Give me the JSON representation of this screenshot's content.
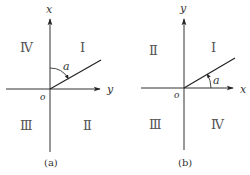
{
  "panels": [
    {
      "caption": "(a)",
      "vertical_axis_label": "x",
      "horizontal_axis_label": "y",
      "origin_label": "o",
      "angle_label": "a",
      "angle_measured_from": "vertical axis (x)",
      "quadrants": {
        "top_left": "Ⅳ",
        "top_right": "Ⅰ",
        "bottom_left": "Ⅲ",
        "bottom_right": "Ⅱ"
      }
    },
    {
      "caption": "(b)",
      "vertical_axis_label": "y",
      "horizontal_axis_label": "x",
      "origin_label": "o",
      "angle_label": "a",
      "angle_measured_from": "horizontal axis (x)",
      "quadrants": {
        "top_left": "Ⅱ",
        "top_right": "Ⅰ",
        "bottom_left": "Ⅲ",
        "bottom_right": "Ⅳ"
      }
    }
  ],
  "colors": {
    "line": "#333333",
    "background": "#ffffff"
  }
}
